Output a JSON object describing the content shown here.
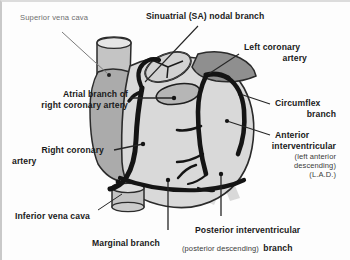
{
  "figure": {
    "background_color": "#fdfdfd",
    "frame_color": "#c9c9c9"
  },
  "palette": {
    "vessel_dark": "#141414",
    "ventricle_fill": "#d9d9d9",
    "atrium_fill": "#ababab",
    "auricle_fill": "#8f8f8f",
    "vessel_tube_fill": "#c4c4c4",
    "shadow_gray": "#b5b5b5",
    "outline": "#2b2b2b",
    "leader_line": "#262626",
    "label_bold": "#1a1a1a",
    "label_light": "#6e6e6e"
  },
  "labels": {
    "superior_vena_cava": "Superior vena cava",
    "sinuatrial_nodal_branch": "Sinuatrial (SA) nodal branch",
    "left_coronary_artery_line1": "Left coronary",
    "left_coronary_artery_line2": "artery",
    "atrial_branch_line1": "Atrial branch of",
    "atrial_branch_line2": "right coronary artery",
    "circumflex_line1": "Circumflex",
    "circumflex_line2": "branch",
    "right_coronary_line1": "Right coronary",
    "right_coronary_line2": "artery",
    "anterior_interventricular_line1": "Anterior",
    "anterior_interventricular_line2": "interventricular",
    "anterior_interventricular_sub1": "(left anterior",
    "anterior_interventricular_sub2": "descending)",
    "anterior_interventricular_sub3": "(L.A.D.)",
    "inferior_vena_cava": "Inferior vena cava",
    "marginal_branch": "Marginal branch",
    "posterior_interventricular_line1": "Posterior interventricular",
    "posterior_interventricular_line2_a": "(posterior descending)",
    "posterior_interventricular_line2_b": "branch"
  }
}
